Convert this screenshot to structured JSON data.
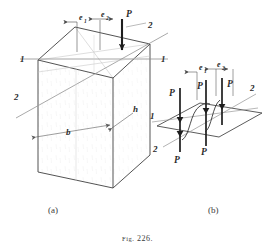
{
  "figure": {
    "caption_prefix": "Fig.",
    "caption_number": "226.",
    "caption_full": "Fig. 226."
  },
  "panels": [
    {
      "id": "a",
      "label": "(a)",
      "description": "rectangular prism block with eccentric loads on top face",
      "labels": {
        "axis_1_left": "1",
        "axis_1_right": "1",
        "axis_2_left": "2",
        "axis_2_right": "2",
        "width_dim": "b",
        "depth_dim": "h",
        "eccentricity_1": "e",
        "eccentricity_1_sub": "1",
        "eccentricity_2": "e",
        "eccentricity_2_sub": "2",
        "load": "P"
      }
    },
    {
      "id": "b",
      "label": "(b)",
      "description": "equivalent force system: plane with four P forces and couples",
      "labels": {
        "axis_1": "1",
        "axis_2": "2",
        "eccentricity_1": "e",
        "eccentricity_1_sub": "1",
        "eccentricity_2": "e",
        "eccentricity_2_sub": "2",
        "force_top_left": "P",
        "force_top_mid": "P",
        "force_top_right": "P",
        "force_bottom_left": "P",
        "force_bottom_mid": "P"
      }
    }
  ],
  "colors": {
    "ink": "#3a3a3a",
    "ink_dark": "#1e1e1e",
    "ink_light": "#8a8a8a",
    "ink_faint": "#b4b4b4",
    "paper": "#ffffff"
  }
}
